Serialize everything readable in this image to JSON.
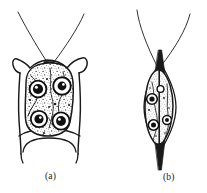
{
  "figure": {
    "type": "scientific-illustration",
    "background_color": "#ffffff",
    "ink_color": "#1a1a1a",
    "panels": [
      {
        "id": "a",
        "caption": "(a)",
        "view": "ventral view",
        "description": "rounded square cell body enclosed in a lorica with two lateral apical horns, a skirt-like posterior flange bearing two downward spines, and two long curved apical flagella",
        "flagella_count": 2,
        "apical_horns": 2,
        "posterior_spines": 2,
        "organelle_count": 4,
        "cytoplasm_texture": "stippled granular"
      },
      {
        "id": "b",
        "caption": "(b)",
        "view": "lateral view",
        "description": "narrow spindle-shaped cell drawn edge on, with a pointed apex, a pointed posterior tail spine, a vertical midline suture and two long flagella converging at the apex",
        "flagella_count": 2,
        "apical_horns": 0,
        "posterior_spines": 1,
        "organelle_count": 4,
        "cytoplasm_texture": "stippled granular"
      }
    ]
  },
  "captions": {
    "panel_a": "(a)",
    "panel_b": "(b)"
  }
}
